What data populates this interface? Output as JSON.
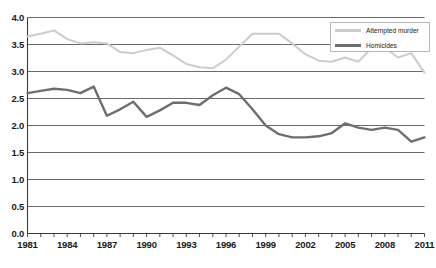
{
  "chart_data": {
    "type": "line",
    "title": "",
    "subtitle": "",
    "xlabel": "",
    "ylabel": "",
    "xlim": [
      1981,
      2011
    ],
    "ylim": [
      0.0,
      4.0
    ],
    "ytick_step": 0.5,
    "grid": true,
    "grid_axis": "y",
    "legend_position": "top-right",
    "x": [
      1981,
      1982,
      1983,
      1984,
      1985,
      1986,
      1987,
      1988,
      1989,
      1990,
      1991,
      1992,
      1993,
      1994,
      1995,
      1996,
      1997,
      1998,
      1999,
      2000,
      2001,
      2002,
      2003,
      2004,
      2005,
      2006,
      2007,
      2008,
      2009,
      2010,
      2011
    ],
    "yticks": [
      "0.0",
      "0.5",
      "1.0",
      "1.5",
      "2.0",
      "2.5",
      "3.0",
      "3.5",
      "4.0"
    ],
    "xticks": [
      "1981",
      "1984",
      "1987",
      "1990",
      "1993",
      "1996",
      "1999",
      "2002",
      "2005",
      "2008",
      "2011"
    ],
    "series": [
      {
        "name": "Attempted murder",
        "color": "#cccccc",
        "values": [
          3.65,
          3.7,
          3.76,
          3.6,
          3.52,
          3.54,
          3.52,
          3.36,
          3.34,
          3.4,
          3.44,
          3.3,
          3.14,
          3.08,
          3.06,
          3.22,
          3.46,
          3.7,
          3.7,
          3.7,
          3.52,
          3.32,
          3.2,
          3.18,
          3.26,
          3.18,
          3.44,
          3.44,
          3.26,
          3.34,
          2.98
        ]
      },
      {
        "name": "Homicides",
        "color": "#6e6e6e",
        "values": [
          2.6,
          2.64,
          2.68,
          2.66,
          2.6,
          2.72,
          2.18,
          2.3,
          2.44,
          2.16,
          2.28,
          2.42,
          2.42,
          2.38,
          2.56,
          2.7,
          2.58,
          2.3,
          2.0,
          1.84,
          1.78,
          1.78,
          1.8,
          1.86,
          2.04,
          1.96,
          1.92,
          1.96,
          1.92,
          1.7,
          1.78
        ]
      }
    ]
  },
  "legend": {
    "items": [
      {
        "label": "Attempted murder",
        "color": "#cccccc"
      },
      {
        "label": "Homicides",
        "color": "#6e6e6e"
      }
    ]
  },
  "axes": {
    "y_min_label": "0.0",
    "y_max_label": "4.0",
    "x_min_label": "1981",
    "x_max_label": "2011"
  }
}
